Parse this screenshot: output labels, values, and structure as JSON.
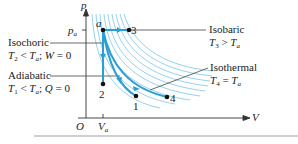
{
  "diagram": {
    "axes": {
      "y_label": "p",
      "x_label": "V",
      "origin": "O",
      "p_tick": "p_a",
      "v_tick": "V_a"
    },
    "points": [
      {
        "id": "a",
        "label": "a"
      },
      {
        "id": "3",
        "label": "3"
      },
      {
        "id": "2",
        "label": "2"
      },
      {
        "id": "1",
        "label": "1"
      },
      {
        "id": "4",
        "label": "4"
      }
    ],
    "annotations": {
      "isochoric": {
        "title": "Isochoric",
        "line2_a": "T",
        "sub2_a": "2",
        "line2_b": " < ",
        "line2_c": "T",
        "sub2_c": "a",
        "line2_d": "; ",
        "line2_e": "W",
        "line2_f": " = 0"
      },
      "adiabatic": {
        "title": "Adiabatic",
        "line2_a": "T",
        "sub2_a": "1",
        "line2_b": " < ",
        "line2_c": "T",
        "sub2_c": "a",
        "line2_d": "; ",
        "line2_e": "Q",
        "line2_f": " = 0"
      },
      "isobaric": {
        "title": "Isobaric",
        "line2_a": "T",
        "sub2_a": "3",
        "line2_b": " > ",
        "line2_c": "T",
        "sub2_c": "a"
      },
      "isothermal": {
        "title": "Isothermal",
        "line2_a": "T",
        "sub2_a": "4",
        "line2_b": " = ",
        "line2_c": "T",
        "sub2_c": "a"
      }
    },
    "colors": {
      "curve": "#2a9fd6",
      "isotherm": "#7cc4e8",
      "axis": "#333333",
      "leader": "#444444"
    }
  }
}
